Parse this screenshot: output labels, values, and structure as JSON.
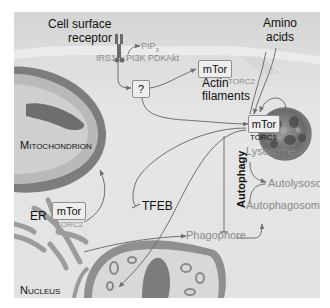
{
  "figure": {
    "type": "mTOR signaling pathway diagram",
    "colors": {
      "background": "#e4e4e4",
      "membrane": "#cfcfcf",
      "arrow": "#6f6f6f",
      "dark_text": "#111111",
      "grey_text": "#8a8a8a",
      "box_border": "#8e8e8e"
    }
  },
  "labels": {
    "cell_surface_receptor": "Cell surface\nreceptor",
    "cell_surface_line1": "Cell surface",
    "cell_surface_line2": "receptor",
    "amino_acids_line1": "Amino",
    "amino_acids_line2": "acids",
    "irs1": "IRS1",
    "pip3": "PIP",
    "pip3_sub": "3",
    "pi3k": "PI3K",
    "pdk": "PDK",
    "akt": "Akt",
    "unknown": "?",
    "actin_line1": "Actin",
    "actin_line2": "filaments",
    "mitochondrion": "Mitochondrion",
    "er": "ER",
    "tfeb": "TFEB",
    "lysosome": "Lysosome",
    "autophagy": "Autophagy",
    "autolysosome": "Autolysosome",
    "autophagosome": "Autophagosome",
    "phagophore": "Phagophore",
    "nucleus": "Nucleus"
  },
  "complexes": {
    "torc2_top": {
      "name": "mTor",
      "sub": "TORC2"
    },
    "torc1": {
      "name": "mTor",
      "sub": "TORC1"
    },
    "torc2_er": {
      "name": "mTor",
      "sub": "TORC2"
    }
  }
}
